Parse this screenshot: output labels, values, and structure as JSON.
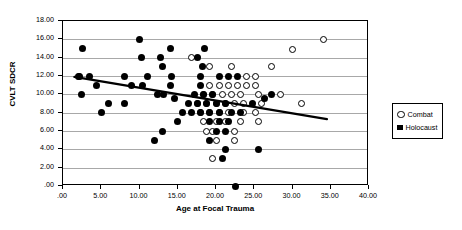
{
  "chart_data": {
    "type": "scatter",
    "title": "",
    "xlabel": "Age at Focal Trauma",
    "ylabel": "CVLT SDCR",
    "xlim": [
      0,
      40
    ],
    "ylim": [
      0,
      18
    ],
    "grid": true,
    "legend_position": "right-outside",
    "xticks": [
      ".00",
      "5.00",
      "10.00",
      "15.00",
      "20.00",
      "25.00",
      "30.00",
      "35.00",
      "40.00"
    ],
    "xtick_values": [
      0,
      5,
      10,
      15,
      20,
      25,
      30,
      35,
      40
    ],
    "yticks": [
      ".00",
      "2.00",
      "4.00",
      "6.00",
      "8.00",
      "10.00",
      "12.00",
      "14.00",
      "16.00",
      "18.00"
    ],
    "ytick_values": [
      0,
      2,
      4,
      6,
      8,
      10,
      12,
      14,
      16,
      18
    ],
    "series": [
      {
        "name": "Combat",
        "marker": "open-circle",
        "color": "#000000",
        "points": [
          [
            16.8,
            14.0
          ],
          [
            30.0,
            14.9
          ],
          [
            34.0,
            16.0
          ],
          [
            27.2,
            13.0
          ],
          [
            22.0,
            13.0
          ],
          [
            19.2,
            13.0
          ],
          [
            24.0,
            12.0
          ],
          [
            25.2,
            12.0
          ],
          [
            20.4,
            11.0
          ],
          [
            21.6,
            11.0
          ],
          [
            22.8,
            11.0
          ],
          [
            24.0,
            11.0
          ],
          [
            25.2,
            11.0
          ],
          [
            19.2,
            11.0
          ],
          [
            18.4,
            10.0
          ],
          [
            19.6,
            10.0
          ],
          [
            20.8,
            10.0
          ],
          [
            22.0,
            10.0
          ],
          [
            23.2,
            10.0
          ],
          [
            25.6,
            10.0
          ],
          [
            28.4,
            10.0
          ],
          [
            17.6,
            9.0
          ],
          [
            18.8,
            9.0
          ],
          [
            20.0,
            9.0
          ],
          [
            21.2,
            9.0
          ],
          [
            22.4,
            9.0
          ],
          [
            23.6,
            9.0
          ],
          [
            26.0,
            9.0
          ],
          [
            31.2,
            9.0
          ],
          [
            18.0,
            8.0
          ],
          [
            19.2,
            8.0
          ],
          [
            20.4,
            8.0
          ],
          [
            21.6,
            8.0
          ],
          [
            23.6,
            8.0
          ],
          [
            25.2,
            8.0
          ],
          [
            18.4,
            7.0
          ],
          [
            20.0,
            7.0
          ],
          [
            21.2,
            7.0
          ],
          [
            23.2,
            7.0
          ],
          [
            25.6,
            7.0
          ],
          [
            18.8,
            6.0
          ],
          [
            19.6,
            6.0
          ],
          [
            22.4,
            6.0
          ],
          [
            20.0,
            5.0
          ],
          [
            22.4,
            5.0
          ],
          [
            19.6,
            3.0
          ]
        ]
      },
      {
        "name": "Holocaust",
        "marker": "filled-circle",
        "color": "#000000",
        "points": [
          [
            2.5,
            15.0
          ],
          [
            10.0,
            16.0
          ],
          [
            14.0,
            15.0
          ],
          [
            18.5,
            15.0
          ],
          [
            10.2,
            14.0
          ],
          [
            12.8,
            14.0
          ],
          [
            17.6,
            14.0
          ],
          [
            2.2,
            12.0
          ],
          [
            3.4,
            12.0
          ],
          [
            8.0,
            12.0
          ],
          [
            11.0,
            12.0
          ],
          [
            14.2,
            12.0
          ],
          [
            18.0,
            12.0
          ],
          [
            20.4,
            12.0
          ],
          [
            21.6,
            12.0
          ],
          [
            22.8,
            12.0
          ],
          [
            13.0,
            13.0
          ],
          [
            18.2,
            13.0
          ],
          [
            2.0,
            11.9
          ],
          [
            4.4,
            11.0
          ],
          [
            9.0,
            11.0
          ],
          [
            10.4,
            11.0
          ],
          [
            14.0,
            11.0
          ],
          [
            18.0,
            11.0
          ],
          [
            2.4,
            10.0
          ],
          [
            12.4,
            10.0
          ],
          [
            13.2,
            10.0
          ],
          [
            17.2,
            10.0
          ],
          [
            18.4,
            10.0
          ],
          [
            19.6,
            10.0
          ],
          [
            27.2,
            10.0
          ],
          [
            14.6,
            9.5
          ],
          [
            16.4,
            9.0
          ],
          [
            17.6,
            9.0
          ],
          [
            18.8,
            9.0
          ],
          [
            20.0,
            9.0
          ],
          [
            21.2,
            9.0
          ],
          [
            24.8,
            9.0
          ],
          [
            26.4,
            9.5
          ],
          [
            6.0,
            9.0
          ],
          [
            8.0,
            9.0
          ],
          [
            5.0,
            8.0
          ],
          [
            15.6,
            8.0
          ],
          [
            16.8,
            8.0
          ],
          [
            18.0,
            8.0
          ],
          [
            19.2,
            8.0
          ],
          [
            20.4,
            8.0
          ],
          [
            22.0,
            8.0
          ],
          [
            23.2,
            8.0
          ],
          [
            15.0,
            7.0
          ],
          [
            19.2,
            7.0
          ],
          [
            20.4,
            7.0
          ],
          [
            21.6,
            7.0
          ],
          [
            13.0,
            6.0
          ],
          [
            20.0,
            6.0
          ],
          [
            21.2,
            6.0
          ],
          [
            12.0,
            5.0
          ],
          [
            19.2,
            5.0
          ],
          [
            21.2,
            4.0
          ],
          [
            20.8,
            3.0
          ],
          [
            22.5,
            0.0
          ],
          [
            25.6,
            4.0
          ]
        ]
      }
    ],
    "trendline": {
      "type": "linear-fit",
      "x_start": 1.5,
      "y_start": 11.9,
      "x_end": 34.5,
      "y_end": 7.3
    }
  },
  "legend": {
    "items": [
      {
        "label": "Combat",
        "marker": "open-circle"
      },
      {
        "label": "Holocaust",
        "marker": "filled-square"
      }
    ]
  }
}
